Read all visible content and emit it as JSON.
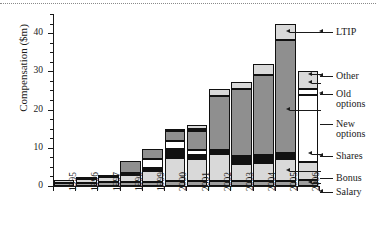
{
  "chart_data": {
    "type": "bar",
    "subtype": "stacked-bar",
    "title": "",
    "xlabel": "",
    "ylabel": "Compensation ($m)",
    "ylim": [
      0,
      45
    ],
    "ytick_values": [
      0,
      10,
      20,
      30,
      40
    ],
    "ytick_labels": [
      "0",
      "10",
      "20",
      "30",
      "40"
    ],
    "yminor_step": 2.5,
    "grid": false,
    "legend_position": "right",
    "categories": [
      "1995",
      "1996",
      "1997",
      "1998",
      "1999",
      "2000",
      "2001",
      "2002",
      "2003",
      "2004",
      "2005",
      "2006"
    ],
    "series": [
      {
        "name": "Salary",
        "fill": "#9e9e9e",
        "values": [
          0.9,
          0.9,
          1.0,
          1.0,
          1.1,
          1.2,
          1.2,
          1.3,
          1.3,
          1.4,
          1.4,
          1.5
        ]
      },
      {
        "name": "Bonus",
        "fill": "#d9d9d9",
        "values": [
          0.7,
          0.9,
          1.3,
          2.0,
          2.9,
          6.1,
          5.8,
          7.2,
          4.5,
          4.6,
          5.6,
          4.8
        ]
      },
      {
        "name": "Shares",
        "fill": "#111111",
        "values": [
          0.0,
          0.0,
          0.6,
          0.5,
          0.6,
          2.4,
          1.2,
          1.0,
          2.0,
          2.0,
          1.6,
          0.0
        ]
      },
      {
        "name": "New options",
        "fill": "#ffffff",
        "values": [
          0.0,
          0.0,
          0.0,
          0.0,
          2.5,
          2.2,
          1.1,
          0.0,
          0.0,
          0.0,
          0.0,
          17.5
        ]
      },
      {
        "name": "Old options",
        "fill": "#8f8f8f",
        "values": [
          0.0,
          0.5,
          0.0,
          3.1,
          2.6,
          2.5,
          5.0,
          14.0,
          17.5,
          21.0,
          29.5,
          0.0
        ]
      },
      {
        "name": "Other",
        "fill": "#ffffff",
        "values": [
          0.0,
          0.0,
          0.0,
          0.0,
          0.0,
          0.0,
          0.5,
          0.0,
          0.0,
          0.0,
          0.0,
          1.6
        ]
      },
      {
        "name": "LTIP",
        "fill": "#d9d9d9",
        "values": [
          0.0,
          0.0,
          0.0,
          0.0,
          0.0,
          0.3,
          1.1,
          1.8,
          2.0,
          3.0,
          4.4,
          4.6
        ]
      }
    ],
    "totals": [
      1.6,
      2.3,
      2.9,
      6.6,
      9.7,
      14.7,
      15.9,
      25.3,
      27.3,
      32.0,
      42.5,
      30.0
    ],
    "annotations": [
      {
        "label": "LTIP",
        "target_year": "2005",
        "target_value": 40.3
      },
      {
        "label": "Other",
        "target_year": "2006",
        "target_value": 29.2
      },
      {
        "label": "Old options",
        "target_year": "2006",
        "target_value": 27.0
      },
      {
        "label": "New options",
        "target_year": "2005",
        "target_value": 20.0
      },
      {
        "label": "Shares",
        "target_year": "2006",
        "target_value": 8.5
      },
      {
        "label": "Bonus",
        "target_year": "2005",
        "target_value": 4.0
      },
      {
        "label": "Salary",
        "target_year": "2006",
        "target_value": 0.8
      }
    ]
  },
  "legend": {
    "items": [
      {
        "label": "LTIP",
        "label2": "",
        "arrow": true
      },
      {
        "label": "Other",
        "label2": "",
        "arrow": true
      },
      {
        "label": "Old",
        "label2": "options",
        "arrow": true
      },
      {
        "label": "New",
        "label2": "options",
        "arrow": false
      },
      {
        "label": "Shares",
        "label2": "",
        "arrow": true
      },
      {
        "label": "Bonus",
        "label2": "",
        "arrow": false
      },
      {
        "label": "Salary",
        "label2": "",
        "arrow": true
      }
    ]
  }
}
